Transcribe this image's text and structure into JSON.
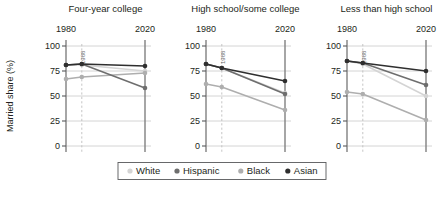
{
  "chart_data": {
    "type": "line",
    "title": "",
    "xlabel": "",
    "ylabel": "Married share (%)",
    "ylim": [
      0,
      100
    ],
    "yticks": [
      0,
      25,
      50,
      75,
      100
    ],
    "ytick_labels": [
      "0",
      "25",
      "50",
      "75",
      "100"
    ],
    "xlim": [
      1980,
      2020
    ],
    "xticks": [
      1980,
      2020
    ],
    "xtick_labels": [
      "1980",
      "2020"
    ],
    "grid": true,
    "legend_position": "bottom",
    "reference_line": {
      "x": 1988,
      "label": "1988",
      "style": "dashed"
    },
    "series_names": [
      "White",
      "Hispanic",
      "Black",
      "Asian"
    ],
    "series_colors": {
      "White": "#d4d4d4",
      "Hispanic": "#6e6e6e",
      "Black": "#aeaeae",
      "Asian": "#2f2f2f"
    },
    "panels": [
      {
        "title": "Four-year college",
        "x": [
          1980,
          1988,
          2020
        ],
        "series": [
          {
            "name": "White",
            "values": [
              81,
              81,
              75
            ]
          },
          {
            "name": "Hispanic",
            "values": [
              81,
              82,
              58
            ]
          },
          {
            "name": "Black",
            "values": [
              67,
              69,
              73
            ]
          },
          {
            "name": "Asian",
            "values": [
              81,
              82,
              80
            ]
          }
        ]
      },
      {
        "title": "High school/some college",
        "x": [
          1980,
          1988,
          2020
        ],
        "series": [
          {
            "name": "White",
            "values": [
              82,
              78,
              53
            ]
          },
          {
            "name": "Hispanic",
            "values": [
              82,
              78,
              52
            ]
          },
          {
            "name": "Black",
            "values": [
              62,
              59,
              36
            ]
          },
          {
            "name": "Asian",
            "values": [
              82,
              78,
              65
            ]
          }
        ]
      },
      {
        "title": "Less than high school",
        "x": [
          1980,
          1988,
          2020
        ],
        "series": [
          {
            "name": "White",
            "values": [
              85,
              82,
              50
            ]
          },
          {
            "name": "Hispanic",
            "values": [
              85,
              83,
              61
            ]
          },
          {
            "name": "Black",
            "values": [
              54,
              52,
              26
            ]
          },
          {
            "name": "Asian",
            "values": [
              85,
              83,
              75
            ]
          }
        ]
      }
    ],
    "legend": [
      {
        "label": "White",
        "color": "#d4d4d4"
      },
      {
        "label": "Hispanic",
        "color": "#6e6e6e"
      },
      {
        "label": "Black",
        "color": "#aeaeae"
      },
      {
        "label": "Asian",
        "color": "#2f2f2f"
      }
    ]
  }
}
